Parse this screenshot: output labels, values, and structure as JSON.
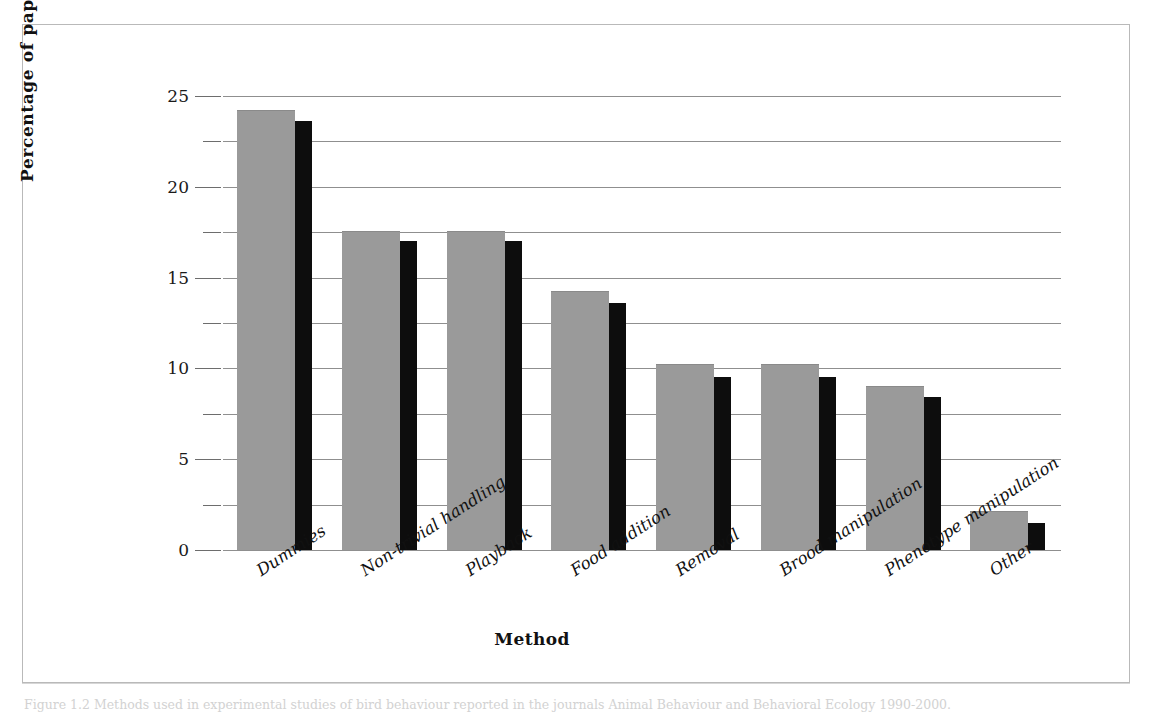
{
  "figure": {
    "caption": "Figure 1.2 Methods used in experimental studies of bird behaviour reported in the journals Animal Behaviour and Behavioral Ecology 1990-2000."
  },
  "chart_data": {
    "type": "bar",
    "title": "",
    "xlabel": "Method",
    "ylabel": "Percentage of papers",
    "ylim": [
      0,
      25
    ],
    "yticks": [
      0,
      5,
      10,
      15,
      20,
      25
    ],
    "ytick_labels": [
      "0",
      "5",
      "10",
      "15",
      "20",
      "25"
    ],
    "minor_ticks": [
      2.5,
      7.5,
      12.5,
      17.5,
      22.5
    ],
    "grid": true,
    "grid_axis": "y",
    "legend": null,
    "legend_position": "none",
    "label_rotation": -33,
    "categories": [
      "Dummies",
      "Non-trivial handling",
      "Playback",
      "Food addition",
      "Removal",
      "Brood manipulation",
      "Phenotype manipulation",
      "Other"
    ],
    "series": [
      {
        "name": "Grey bars",
        "color": "#9a9a9a",
        "values": [
          24.2,
          17.5,
          17.5,
          14.2,
          10.2,
          10.2,
          9.0,
          2.1
        ]
      },
      {
        "name": "Black bars",
        "color": "#0d0d0d",
        "values": [
          23.6,
          17.0,
          17.0,
          13.6,
          9.5,
          9.5,
          8.4,
          1.5
        ]
      }
    ]
  },
  "colors": {
    "primary_bar": "#9a9a9a",
    "secondary_bar": "#0d0d0d",
    "gridline": "#8f8f8f",
    "frame": "#b9b9b9",
    "text": "#111111"
  }
}
